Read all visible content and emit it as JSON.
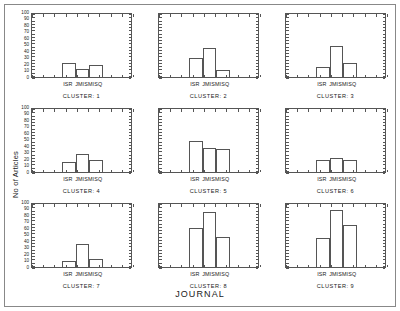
{
  "chart_data": {
    "type": "bar",
    "title": "",
    "xlabel": "JOURNAL",
    "ylabel": "No of Articles",
    "categories": [
      "ISR",
      "JMIS",
      "MISQ"
    ],
    "ylim": [
      0,
      100
    ],
    "yticks": [
      0,
      10,
      20,
      30,
      40,
      50,
      60,
      70,
      80,
      90,
      100
    ],
    "ytick_labels": [
      "0",
      "10",
      "20",
      "30",
      "40",
      "50",
      "60",
      "70",
      "80",
      "90",
      "100"
    ],
    "grid": false,
    "legend": "none",
    "layout": {
      "rows": 3,
      "cols": 3,
      "facet_by": "CLUSTER"
    },
    "panels": [
      {
        "caption": "CLUSTER: 1",
        "values": [
          22,
          12,
          18
        ]
      },
      {
        "caption": "CLUSTER: 2",
        "values": [
          30,
          45,
          11
        ]
      },
      {
        "caption": "CLUSTER: 3",
        "values": [
          15,
          48,
          22
        ]
      },
      {
        "caption": "CLUSTER: 4",
        "values": [
          16,
          28,
          19
        ]
      },
      {
        "caption": "CLUSTER: 5",
        "values": [
          48,
          37,
          35
        ]
      },
      {
        "caption": "CLUSTER: 6",
        "values": [
          19,
          22,
          19
        ]
      },
      {
        "caption": "CLUSTER: 7",
        "values": [
          10,
          35,
          13
        ]
      },
      {
        "caption": "CLUSTER: 8",
        "values": [
          60,
          84,
          46
        ]
      },
      {
        "caption": "CLUSTER: 9",
        "values": [
          44,
          88,
          65
        ]
      }
    ]
  },
  "colors": {
    "axis": "#555555",
    "frame": "#888888",
    "text": "#1a1a1a",
    "background": "#ffffff",
    "bar_fill": "transparent"
  }
}
